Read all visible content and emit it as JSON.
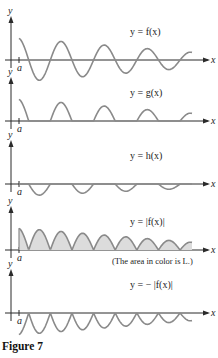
{
  "chart_data": {
    "type": "line",
    "title": "",
    "caption": "Figure 7",
    "panels": [
      {
        "id": "f",
        "label": "y = f(x)",
        "xlabel": "x",
        "ylabel": "y",
        "tick_label": "a",
        "transform": "f",
        "fill": false
      },
      {
        "id": "g",
        "label": "y = g(x)",
        "xlabel": "x",
        "ylabel": "y",
        "tick_label": "a",
        "transform": "pos",
        "fill": false
      },
      {
        "id": "h",
        "label": "y = h(x)",
        "xlabel": "x",
        "ylabel": "y",
        "tick_label": "a",
        "transform": "neg",
        "fill": false
      },
      {
        "id": "absf",
        "label": "y = |f(x)|",
        "xlabel": "x",
        "ylabel": "y",
        "tick_label": "a",
        "transform": "abs",
        "fill": true,
        "note": "(The area in color is L.)"
      },
      {
        "id": "negabsf",
        "label": "y = − |f(x)|",
        "xlabel": "x",
        "ylabel": "y",
        "tick_label": "a",
        "transform": "negabs",
        "fill": false
      }
    ],
    "function": {
      "description": "damped oscillation starting at x = a",
      "x_range": [
        0,
        10
      ],
      "amplitude_start": 1.0,
      "amplitude_end": 0.35,
      "half_periods": 8
    },
    "colors": {
      "curve": "#8a8a8a",
      "area": "#dcdcdc",
      "axis": "#2a2a2a"
    }
  },
  "figure": {
    "caption": "Figure 7"
  }
}
